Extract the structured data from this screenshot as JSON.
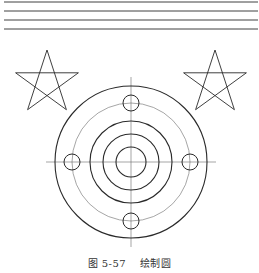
{
  "figure": {
    "caption_number": "图 5-57",
    "caption_title": "绘制圆"
  },
  "drawing": {
    "stroke_color": "#2a2a2a",
    "thin_stroke_color": "#6a6a6a",
    "horizontal_lines": [
      {
        "x1": 4,
        "x2": 258,
        "y": 2
      },
      {
        "x1": 4,
        "x2": 258,
        "y": 11
      },
      {
        "x1": 4,
        "x2": 258,
        "y": 20
      },
      {
        "x1": 4,
        "x2": 258,
        "y": 29
      }
    ],
    "stars": [
      {
        "name": "left-star",
        "cx": 47,
        "cy": 83,
        "r": 33
      },
      {
        "name": "right-star",
        "cx": 215,
        "cy": 83,
        "r": 33
      }
    ],
    "target": {
      "cx": 131,
      "cy": 162,
      "outer_radius": 76,
      "pitch_circle_radius": 59,
      "ring_radii": [
        41,
        28,
        15
      ],
      "small_holes": [
        {
          "cx": 131,
          "cy": 103,
          "r": 8
        },
        {
          "cx": 72,
          "cy": 162,
          "r": 8
        },
        {
          "cx": 190,
          "cy": 162,
          "r": 8
        },
        {
          "cx": 131,
          "cy": 221,
          "r": 8
        }
      ],
      "centerline_extent": 85
    }
  }
}
